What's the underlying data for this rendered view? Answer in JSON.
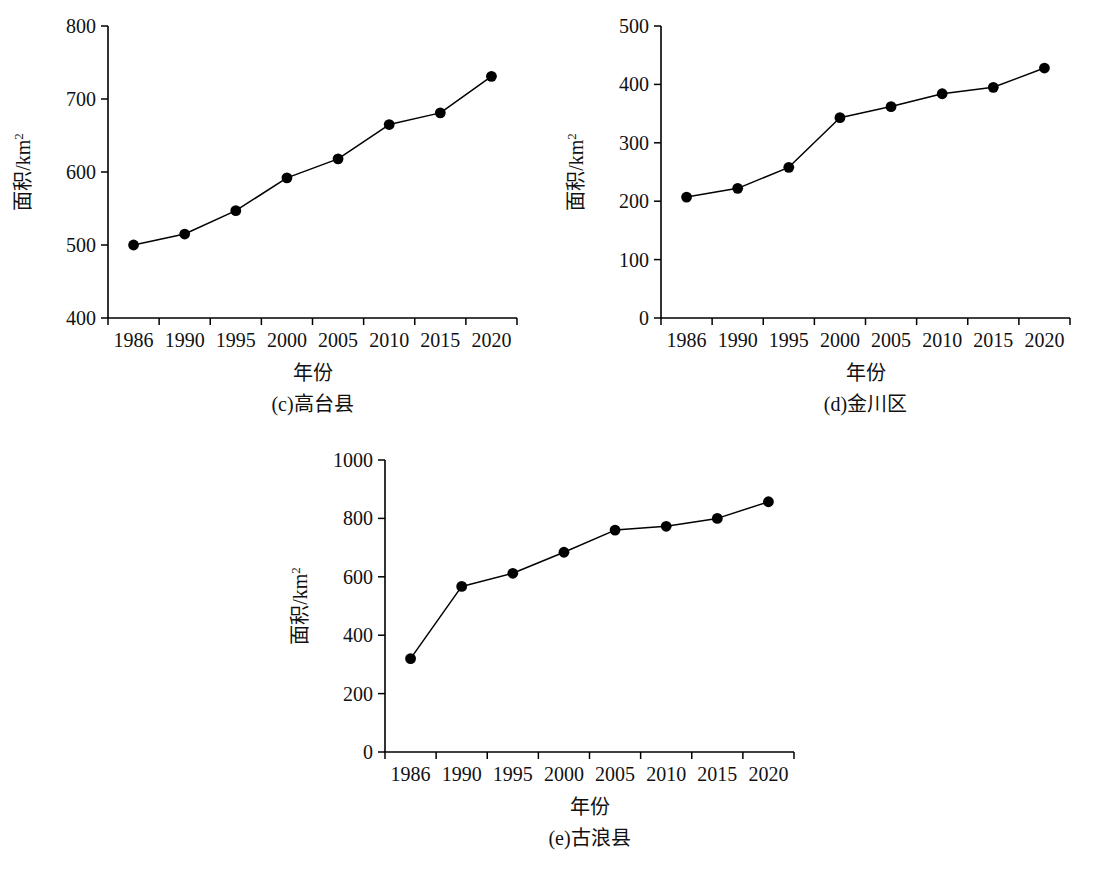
{
  "figure": {
    "background": "#ffffff",
    "ink_color": "#000000",
    "panel_count": 3
  },
  "chart_data": [
    {
      "id": "c",
      "type": "line",
      "title": "(c)高台县",
      "panel_letter": "(c)",
      "region_name": "高台县",
      "xlabel": "年份",
      "ylabel": "面积/km²",
      "ylabel_base": "面积/km",
      "ylabel_exponent": "2",
      "categories": [
        "1986",
        "1990",
        "1995",
        "2000",
        "2005",
        "2010",
        "2015",
        "2020"
      ],
      "values": [
        500,
        515,
        547,
        592,
        618,
        665,
        681,
        731
      ],
      "yticks": [
        400,
        500,
        600,
        700,
        800
      ],
      "ylim": [
        400,
        800
      ],
      "grid": false,
      "legend": false,
      "marker": "circle-filled",
      "series_color": "#000000"
    },
    {
      "id": "d",
      "type": "line",
      "title": "(d)金川区",
      "panel_letter": "(d)",
      "region_name": "金川区",
      "xlabel": "年份",
      "ylabel": "面积/km²",
      "ylabel_base": "面积/km",
      "ylabel_exponent": "2",
      "categories": [
        "1986",
        "1990",
        "1995",
        "2000",
        "2005",
        "2010",
        "2015",
        "2020"
      ],
      "values": [
        207,
        222,
        258,
        343,
        362,
        384,
        395,
        428
      ],
      "yticks": [
        0,
        100,
        200,
        300,
        400,
        500
      ],
      "ylim": [
        0,
        500
      ],
      "grid": false,
      "legend": false,
      "marker": "circle-filled",
      "series_color": "#000000"
    },
    {
      "id": "e",
      "type": "line",
      "title": "(e)古浪县",
      "panel_letter": "(e)",
      "region_name": "古浪县",
      "xlabel": "年份",
      "ylabel": "面积/km²",
      "ylabel_base": "面积/km",
      "ylabel_exponent": "2",
      "categories": [
        "1986",
        "1990",
        "1995",
        "2000",
        "2005",
        "2010",
        "2015",
        "2020"
      ],
      "values": [
        320,
        567,
        612,
        684,
        760,
        773,
        800,
        857
      ],
      "yticks": [
        0,
        200,
        400,
        600,
        800,
        1000
      ],
      "ylim": [
        0,
        1000
      ],
      "grid": false,
      "legend": false,
      "marker": "circle-filled",
      "series_color": "#000000"
    }
  ]
}
